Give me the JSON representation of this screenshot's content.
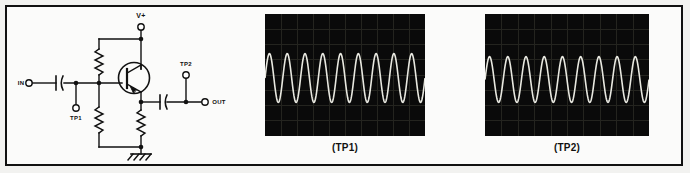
{
  "figure": {
    "background_color": "#f2f2f0",
    "frame_color": "#111111",
    "panel_color": "#fbfbfa"
  },
  "schematic": {
    "title_hidden": "",
    "labels": {
      "supply": "V+",
      "input": "IN",
      "output": "OUT",
      "testpoint1": "TP1",
      "testpoint2": "TP2"
    },
    "components": {
      "transistor_type": "NPN",
      "input_coupling_cap": "input-capacitor",
      "output_coupling_cap": "output-capacitor",
      "collector_resistor": "collector-resistor",
      "base_bias_resistor": "base-bias-resistor",
      "emitter_resistor": "emitter-resistor",
      "ground_symbol": "chassis-ground"
    }
  },
  "scopes": [
    {
      "caption": "(TP1)",
      "trace_color": "#e8e8e0",
      "screen_color": "#0a0a0a",
      "grid_color": "#24241f",
      "grid_cols": 10,
      "grid_rows": 8,
      "cycles": 9,
      "amplitude_div": 1.6,
      "baseline_div": 4.2
    },
    {
      "caption": "(TP2)",
      "trace_color": "#e8e8e0",
      "screen_color": "#0a0a0a",
      "grid_color": "#24241f",
      "grid_cols": 10,
      "grid_rows": 8,
      "cycles": 9,
      "amplitude_div": 1.5,
      "baseline_div": 4.3
    }
  ],
  "chart_data": {
    "type": "line",
    "xlabel": "",
    "ylabel": "",
    "series": [
      {
        "name": "(TP1)",
        "waveform": "sine",
        "cycles": 9,
        "amplitude": 1.0,
        "offset": 0.0,
        "phase_deg": 0
      },
      {
        "name": "(TP2)",
        "waveform": "sine",
        "cycles": 9,
        "amplitude": 0.95,
        "offset": 0.0,
        "phase_deg": 0
      }
    ],
    "xlim": [
      0,
      1
    ],
    "ylim": [
      -1,
      1
    ],
    "grid": true,
    "legend": "none"
  }
}
